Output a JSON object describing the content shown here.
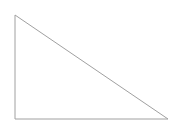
{
  "canvas": {
    "width": 186,
    "height": 132,
    "background_color": "#ffffff"
  },
  "figure": {
    "name": "right-triangle",
    "title": "Right triangle outline",
    "stroke_color": "#a0a0a0",
    "stroke_width": 1,
    "fill_color": "none",
    "vertices": [
      {
        "label": "top-left-apex",
        "x": 15,
        "y": 15
      },
      {
        "label": "bottom-right",
        "x": 168,
        "y": 119
      },
      {
        "label": "bottom-left-right-angle",
        "x": 15,
        "y": 119
      }
    ],
    "points_attr": "15,15 168,119 15,119",
    "edges": [
      {
        "name": "vertical-leg",
        "from": "top-left-apex",
        "to": "bottom-left-right-angle",
        "length_px": 104
      },
      {
        "name": "horizontal-leg",
        "from": "bottom-left-right-angle",
        "to": "bottom-right",
        "length_px": 153
      },
      {
        "name": "hypotenuse",
        "from": "top-left-apex",
        "to": "bottom-right",
        "length_px": 185
      }
    ]
  }
}
